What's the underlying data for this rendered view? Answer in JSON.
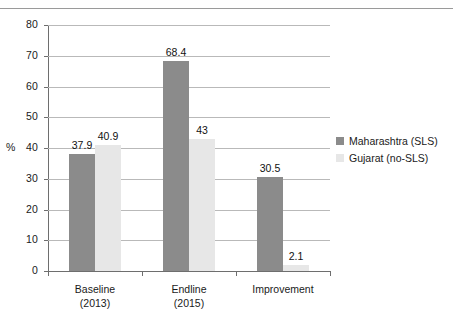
{
  "chart_data": {
    "type": "bar",
    "title": "",
    "subtitle": "",
    "xlabel": "",
    "ylabel": "%",
    "ylim": [
      0,
      80
    ],
    "yticks": [
      0,
      10,
      20,
      30,
      40,
      50,
      60,
      70,
      80
    ],
    "ytick_labels": [
      "0",
      "10",
      "20",
      "30",
      "40",
      "50",
      "60",
      "70",
      "80"
    ],
    "grid": true,
    "legend_position": "right",
    "categories": [
      "Baseline\n(2013)",
      "Endline\n(2015)",
      "Improvement"
    ],
    "category_lines": [
      [
        "Baseline",
        "(2013)"
      ],
      [
        "Endline",
        "(2015)"
      ],
      [
        "Improvement",
        ""
      ]
    ],
    "series": [
      {
        "name": "Maharashtra (SLS)",
        "color": "#8b8b8b",
        "values": [
          37.9,
          68.4,
          30.5
        ],
        "value_labels": [
          "37.9",
          "68.4",
          "30.5"
        ]
      },
      {
        "name": "Gujarat (no-SLS)",
        "color": "#e7e7e7",
        "values": [
          40.9,
          43,
          2.1
        ],
        "value_labels": [
          "40.9",
          "43",
          "2.1"
        ]
      }
    ]
  },
  "legend": {
    "items": [
      {
        "label": "Maharashtra (SLS)",
        "swatch": "dark"
      },
      {
        "label": "Gujarat (no-SLS)",
        "swatch": "light"
      }
    ]
  },
  "axis": {
    "y_title": "%"
  },
  "colors": {
    "series_dark": "#8b8b8b",
    "series_light": "#e7e7e7",
    "gridline": "#b9b9b9",
    "axis": "#6e6e6e",
    "text": "#1a1a1a",
    "background": "#ffffff"
  }
}
